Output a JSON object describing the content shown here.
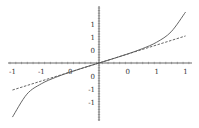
{
  "chart_data": {
    "type": "line",
    "title": "",
    "xlabel": "",
    "ylabel": "",
    "xlim": [
      -1.5,
      1.5
    ],
    "ylim": [
      -2.2,
      2.2
    ],
    "grid": false,
    "legend": null,
    "x_ticks": [
      -1.5,
      -1,
      -0.5,
      0.5,
      1,
      1.5
    ],
    "x_tick_labels": [
      "-1",
      "-1",
      "0",
      "0",
      "1",
      "1"
    ],
    "y_ticks": [
      1.5,
      1,
      0.5,
      -0.5,
      -1,
      -1.5
    ],
    "y_tick_labels": [
      "1",
      "1",
      "0",
      "0",
      "-1",
      "-1"
    ],
    "series": [
      {
        "name": "curve",
        "style": "solid",
        "color": "#555555",
        "x": [
          -1.5,
          -1.25,
          -1.0,
          -0.75,
          -0.5,
          -0.25,
          0,
          0.25,
          0.5,
          0.75,
          1.0,
          1.25,
          1.5
        ],
        "y": [
          -2.08,
          -1.2,
          -0.8,
          -0.55,
          -0.35,
          -0.17,
          0,
          0.17,
          0.35,
          0.55,
          0.8,
          1.2,
          1.96
        ]
      },
      {
        "name": "linear approximation",
        "style": "dashed",
        "color": "#555555",
        "x": [
          -1.5,
          1.5
        ],
        "y": [
          -1.04,
          1.04
        ]
      }
    ]
  },
  "layout": {
    "origin_px": [
      99,
      63
    ],
    "px_per_unit_x": 57.7,
    "px_per_unit_y": 26
  }
}
